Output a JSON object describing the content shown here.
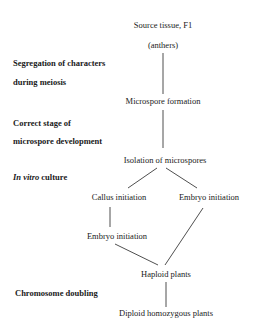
{
  "diagram": {
    "type": "flowchart",
    "nodes": {
      "source": "Source tissue, F1",
      "anthers": "(anthers)",
      "microspore_formation": "Microspore formation",
      "isolation": "Isolation of microspores",
      "callus_initiation": "Callus initiation",
      "embryo_initiation_right": "Embryo initiation",
      "embryo_initiation_left": "Embryo initiation",
      "haploid_plants": "Haploid plants",
      "diploid_plants": "Diploid homozygous plants"
    },
    "stage_labels": {
      "segregation_line1": "Segregation of characters",
      "segregation_line2": "during meiosis",
      "correct_stage_line1": "Correct stage of",
      "correct_stage_line2": "microspore development",
      "in_vitro_italic": "In vitro",
      "in_vitro_rest": " culture",
      "chromosome_doubling": "Chromosome doubling"
    },
    "edges": [
      {
        "from": "anthers",
        "to": "microspore_formation"
      },
      {
        "from": "microspore_formation",
        "to": "isolation"
      },
      {
        "from": "isolation",
        "to": "callus_initiation"
      },
      {
        "from": "isolation",
        "to": "embryo_initiation_right"
      },
      {
        "from": "callus_initiation",
        "to": "embryo_initiation_left"
      },
      {
        "from": "embryo_initiation_left",
        "to": "haploid_plants"
      },
      {
        "from": "embryo_initiation_right",
        "to": "haploid_plants"
      },
      {
        "from": "haploid_plants",
        "to": "diploid_plants"
      }
    ],
    "line_color": "#222222"
  }
}
